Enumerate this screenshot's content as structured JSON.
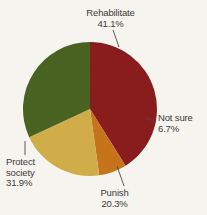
{
  "chart_data": {
    "type": "pie",
    "title": "",
    "subtitle": "",
    "xlabel": "",
    "ylabel": "",
    "legend_position": "none",
    "grid": false,
    "labels_outside": true,
    "categories": [
      "Rehabilitate",
      "Not sure",
      "Punish",
      "Protect society"
    ],
    "values": [
      41.1,
      6.7,
      20.3,
      31.9
    ],
    "value_suffix": "%",
    "start_angle_deg": 0,
    "direction": "clockwise",
    "slices": [
      {
        "name": "Rehabilitate",
        "value": 41.1,
        "value_text": "41.1%",
        "color": "#8c1d1d",
        "label_position": "top"
      },
      {
        "name": "Not sure",
        "value": 6.7,
        "value_text": "6.7%",
        "color": "#c8761a",
        "label_position": "right"
      },
      {
        "name": "Punish",
        "value": 20.3,
        "value_text": "20.3%",
        "color": "#d4b04a",
        "label_position": "bottom"
      },
      {
        "name": "Protect society",
        "value": 31.9,
        "value_text": "31.9%",
        "color": "#4a6420",
        "label_position": "left"
      }
    ]
  },
  "labels": {
    "rehabilitate": {
      "name": "Rehabilitate",
      "pct": "41.1%"
    },
    "notsure": {
      "name": "Not sure",
      "pct": "6.7%"
    },
    "punish": {
      "name": "Punish",
      "pct": "20.3%"
    },
    "protect": {
      "name_line1": "Protect",
      "name_line2": "society",
      "pct": "31.9%"
    }
  },
  "colors": {
    "background": "#f6f4ef",
    "text": "#3c3a38",
    "leader_line": "#4a4846",
    "rehabilitate": "#8c1d1d",
    "notsure": "#c8761a",
    "punish": "#d4b04a",
    "protect": "#4a6420"
  },
  "geometry": {
    "center_x": 90,
    "center_y": 109,
    "radius": 67
  }
}
